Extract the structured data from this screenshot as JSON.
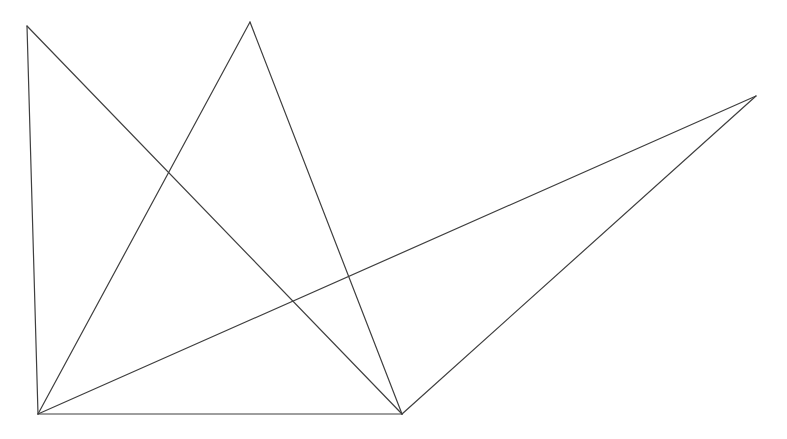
{
  "figure": {
    "width": 787,
    "height": 439,
    "background_color": "#ffffff",
    "stroke_color": "#3f3f3f",
    "stroke_width": 1.2
  },
  "chart_data": {
    "type": "scatter",
    "subtitle": "",
    "xlabel": "",
    "ylabel": "",
    "xlim": [
      0,
      787
    ],
    "ylim": [
      439,
      0
    ],
    "grid": false,
    "legend": "none",
    "axes_visible": false,
    "tick_labels_x": [],
    "tick_labels_y": [],
    "annotations": [],
    "vertices": [
      {
        "id": "A",
        "label": "top-left-apex",
        "x": 27,
        "y": 26
      },
      {
        "id": "B",
        "label": "top-middle-peak",
        "x": 250,
        "y": 22
      },
      {
        "id": "C",
        "label": "right-apex",
        "x": 756,
        "y": 96
      },
      {
        "id": "D",
        "label": "bottom-left-corner",
        "x": 38,
        "y": 414
      },
      {
        "id": "E",
        "label": "bottom-right-node",
        "x": 402,
        "y": 414
      }
    ],
    "edges": [
      {
        "id": "AD",
        "name": "left-vertical-edge",
        "from": "A",
        "to": "D",
        "x1": 27,
        "y1": 26,
        "x2": 38,
        "y2": 414
      },
      {
        "id": "AE",
        "name": "upper-left-diagonal",
        "from": "A",
        "to": "E",
        "x1": 27,
        "y1": 26,
        "x2": 402,
        "y2": 414
      },
      {
        "id": "BD",
        "name": "peak-left-leg",
        "from": "B",
        "to": "D",
        "x1": 250,
        "y1": 22,
        "x2": 38,
        "y2": 414
      },
      {
        "id": "BE",
        "name": "peak-right-leg",
        "from": "B",
        "to": "E",
        "x1": 250,
        "y1": 22,
        "x2": 402,
        "y2": 414
      },
      {
        "id": "DC",
        "name": "long-shallow-diagonal",
        "from": "D",
        "to": "C",
        "x1": 38,
        "y1": 414,
        "x2": 756,
        "y2": 96
      },
      {
        "id": "EC",
        "name": "right-wedge-edge",
        "from": "E",
        "to": "C",
        "x1": 402,
        "y1": 414,
        "x2": 756,
        "y2": 96
      },
      {
        "id": "DE",
        "name": "bottom-baseline",
        "from": "D",
        "to": "E",
        "x1": 38,
        "y1": 414,
        "x2": 402,
        "y2": 414
      }
    ],
    "intersections": [
      {
        "name": "upper-crossing",
        "x": 170,
        "y": 172,
        "edges": [
          "AE",
          "BD"
        ]
      },
      {
        "name": "lower-crossing",
        "x": 291,
        "y": 302,
        "edges": [
          "AE",
          "DC"
        ]
      },
      {
        "name": "right-crossing",
        "x": 352,
        "y": 342,
        "edges": [
          "BE",
          "DC"
        ]
      }
    ]
  }
}
